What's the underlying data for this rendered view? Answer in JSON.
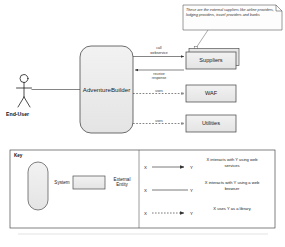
{
  "diagram": {
    "note": {
      "text": "These are the external suppliers like airline providers, lodging providers, travel providers and banks"
    },
    "actor": {
      "label": "End-User"
    },
    "system": {
      "label": "AdventureBuilder"
    },
    "external_entities": [
      {
        "label": "Suppliers",
        "stacked": "true"
      },
      {
        "label": "WAF",
        "stacked": "false"
      },
      {
        "label": "Utilities",
        "stacked": "false"
      }
    ],
    "edges": [
      {
        "label": "call\nwebservice"
      },
      {
        "label": "receive\nresponse"
      },
      {
        "label": "uses"
      },
      {
        "label": "uses"
      }
    ]
  },
  "key": {
    "title": "Key",
    "shapes": [
      {
        "label": "System"
      },
      {
        "label": "External\nEntity"
      }
    ],
    "rows": [
      {
        "from": "X",
        "to": "Y",
        "style": "solid-arrow",
        "description": "X interacts with Y using web services"
      },
      {
        "from": "X",
        "to": "Y",
        "style": "solid-plain",
        "description": "X interacts with Y using a web browser"
      },
      {
        "from": "X",
        "to": "Y",
        "style": "dashed-arrow",
        "description": "X uses Y as a library"
      }
    ]
  }
}
